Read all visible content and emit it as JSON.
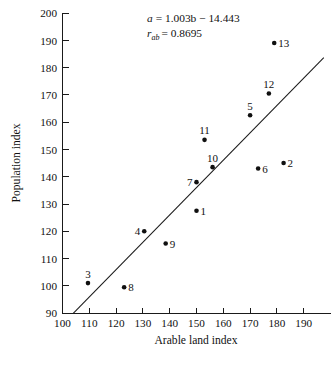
{
  "chart_data": {
    "type": "scatter",
    "title": "",
    "xlabel": "Arable land index",
    "ylabel": "Population index",
    "xlim": [
      100,
      195
    ],
    "ylim": [
      90,
      200
    ],
    "xticks": [
      100,
      110,
      120,
      130,
      140,
      150,
      160,
      170,
      180,
      190
    ],
    "yticks": [
      90,
      100,
      110,
      120,
      130,
      140,
      150,
      160,
      170,
      180,
      190,
      200
    ],
    "grid": false,
    "legend": "none",
    "marker_color": "#101010",
    "line_color": "#1a1a1a",
    "points": [
      {
        "label": "1",
        "x": 150.0,
        "y": 127.5,
        "label_pos": "right"
      },
      {
        "label": "2",
        "x": 182.5,
        "y": 145.0,
        "label_pos": "right"
      },
      {
        "label": "3",
        "x": 109.5,
        "y": 101.0,
        "label_pos": "above"
      },
      {
        "label": "4",
        "x": 130.5,
        "y": 120.0,
        "label_pos": "left"
      },
      {
        "label": "5",
        "x": 170.0,
        "y": 162.5,
        "label_pos": "above"
      },
      {
        "label": "6",
        "x": 173.0,
        "y": 143.0,
        "label_pos": "right"
      },
      {
        "label": "7",
        "x": 150.0,
        "y": 138.0,
        "label_pos": "left"
      },
      {
        "label": "8",
        "x": 123.0,
        "y": 99.5,
        "label_pos": "right"
      },
      {
        "label": "9",
        "x": 138.5,
        "y": 115.5,
        "label_pos": "right"
      },
      {
        "label": "10",
        "x": 156.0,
        "y": 143.5,
        "label_pos": "above"
      },
      {
        "label": "11",
        "x": 153.0,
        "y": 153.5,
        "label_pos": "above"
      },
      {
        "label": "12",
        "x": 177.0,
        "y": 170.5,
        "label_pos": "above"
      },
      {
        "label": "13",
        "x": 179.0,
        "y": 189.0,
        "label_pos": "right"
      }
    ],
    "fit_line": {
      "slope": 1.003,
      "intercept": -14.443,
      "x_start": 104.0,
      "x_end": 197.5
    },
    "annotations": {
      "equation": "a = 1.003b − 14.443",
      "equation_lhs": "a",
      "equation_rhs": "= 1.003b − 14.443",
      "correlation_symbol": "r",
      "correlation_subscript": "ab",
      "correlation_rhs": "= 0.8695",
      "correlation": "r_ab = 0.8695"
    }
  }
}
